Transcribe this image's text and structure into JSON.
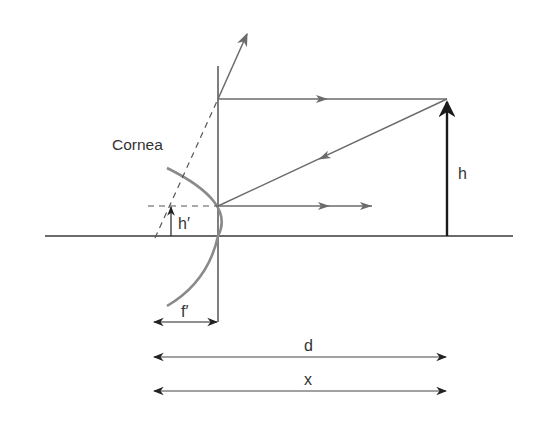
{
  "diagram": {
    "labels": {
      "cornea": "Cornea",
      "object_height": "h",
      "image_height": "h′",
      "focal_length": "f′",
      "distance_d": "d",
      "distance_x": "x"
    },
    "colors": {
      "line": "#3a3a3a",
      "ray": "#6b6b6b",
      "cornea": "#8a8a8a",
      "object": "#1a1a1a",
      "text": "#333333"
    }
  }
}
